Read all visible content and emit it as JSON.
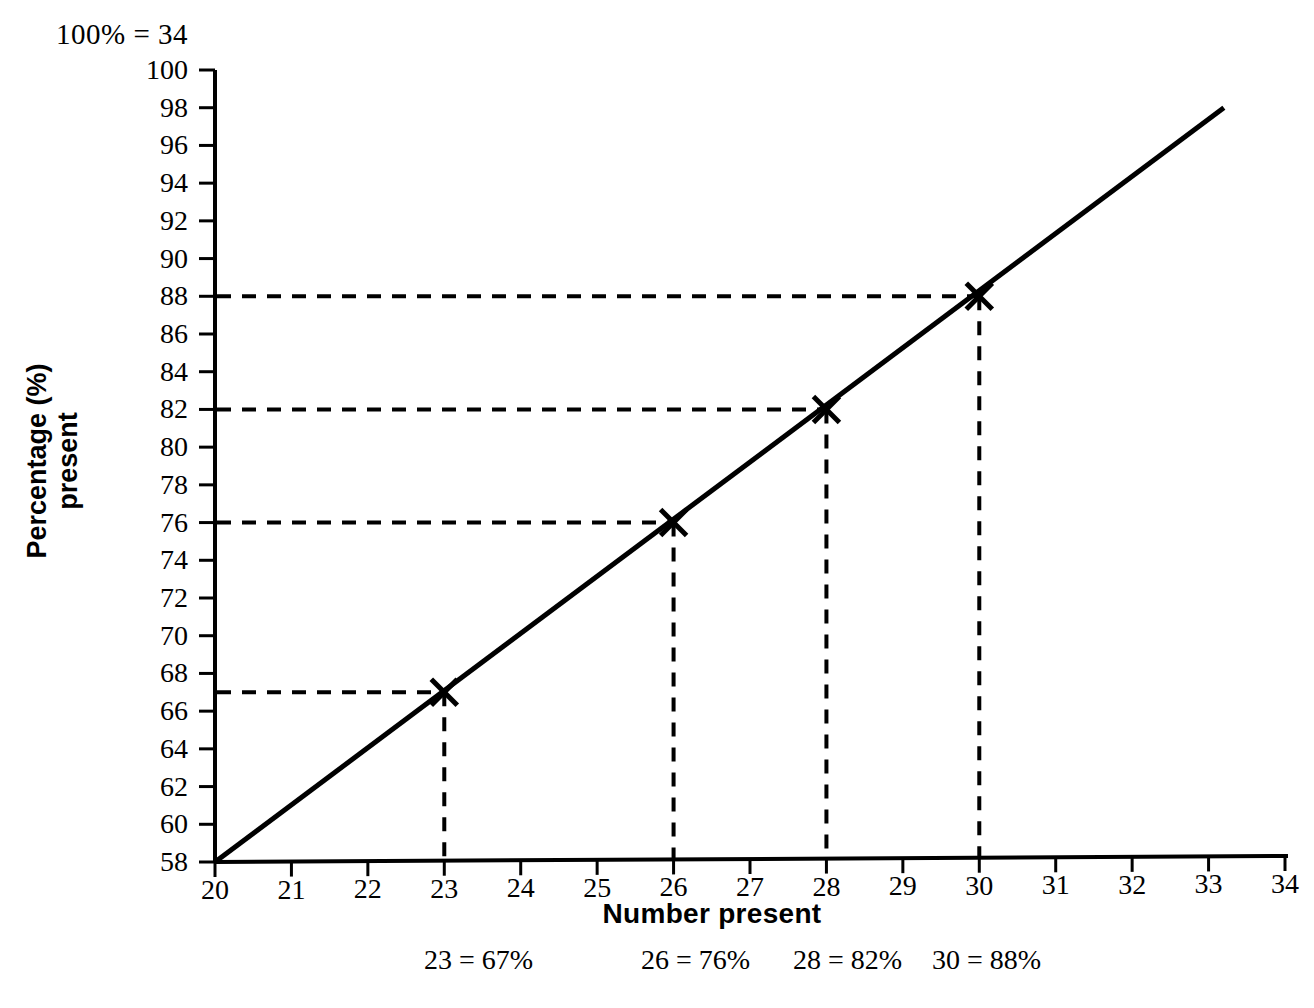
{
  "header_note": "100% = 34",
  "axes": {
    "ylabel_line1": "Percentage (%)",
    "ylabel_line2": "present",
    "xlabel": "Number present"
  },
  "chart_data": {
    "type": "line",
    "title": "",
    "subtitle": "100% = 34",
    "xlabel": "Number present",
    "ylabel": "Percentage (%) present",
    "xlim": [
      20,
      34
    ],
    "ylim": [
      58,
      100
    ],
    "xticks": [
      20,
      21,
      22,
      23,
      24,
      25,
      26,
      27,
      28,
      29,
      30,
      31,
      32,
      33,
      34
    ],
    "xtick_labels": [
      "20",
      "21",
      "22",
      "23",
      "24",
      "25",
      "26",
      "27",
      "28",
      "29",
      "30",
      "31",
      "32",
      "33",
      "34"
    ],
    "yticks": [
      58,
      60,
      62,
      64,
      66,
      68,
      70,
      72,
      74,
      76,
      78,
      80,
      82,
      84,
      86,
      88,
      90,
      92,
      94,
      96,
      98,
      100
    ],
    "ytick_labels": [
      "58",
      "60",
      "62",
      "64",
      "66",
      "68",
      "70",
      "72",
      "74",
      "76",
      "78",
      "80",
      "82",
      "84",
      "86",
      "88",
      "90",
      "92",
      "94",
      "96",
      "98",
      "100"
    ],
    "grid": false,
    "legend": "none",
    "series": [
      {
        "name": "Percentage present",
        "line_style": "solid",
        "x": [
          20,
          33.2
        ],
        "values": [
          58,
          98
        ]
      }
    ],
    "marked_points": [
      {
        "x": 23,
        "y": 67,
        "marker": "x",
        "label": "23 = 67%"
      },
      {
        "x": 26,
        "y": 76,
        "marker": "x",
        "label": "26 = 76%"
      },
      {
        "x": 28,
        "y": 82,
        "marker": "x",
        "label": "28 = 82%"
      },
      {
        "x": 30,
        "y": 88,
        "marker": "x",
        "label": "30 = 88%"
      }
    ],
    "guide_lines": "dashed from y-axis to point, then down to x-axis"
  },
  "annotations": [
    {
      "text": "23 = 67%",
      "left": 424
    },
    {
      "text": "26 = 76%",
      "left": 641
    },
    {
      "text": "28 = 82%",
      "left": 793
    },
    {
      "text": "30 = 88%",
      "left": 932
    }
  ],
  "colors": {
    "line": "#000000",
    "axis": "#000000",
    "background": "#ffffff"
  }
}
